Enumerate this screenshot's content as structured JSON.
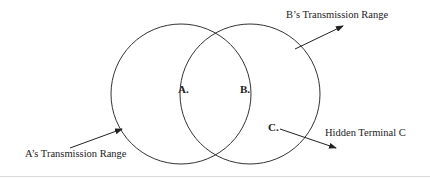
{
  "diagram": {
    "circles": [
      {
        "name": "A's range",
        "cx": 181,
        "cy": 94,
        "r": 70
      },
      {
        "name": "B's range",
        "cx": 250,
        "cy": 94,
        "r": 70
      }
    ],
    "points": {
      "a": "A.",
      "b": "B.",
      "c": "C."
    },
    "labels": {
      "a_range": "A’s Transmission Range",
      "b_range": "B’s Transmission Range",
      "hidden": "Hidden Terminal C"
    },
    "colors": {
      "stroke": "#333333",
      "text": "#222222"
    }
  }
}
